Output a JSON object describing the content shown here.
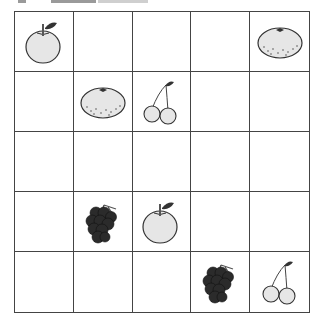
{
  "grid": {
    "rows": 5,
    "cols": 5,
    "cells": [
      [
        "apple",
        "",
        "",
        "",
        "mandarin"
      ],
      [
        "",
        "mandarin",
        "cherry",
        "",
        ""
      ],
      [
        "",
        "",
        "",
        "",
        ""
      ],
      [
        "",
        "grapes",
        "apple",
        "",
        ""
      ],
      [
        "",
        "",
        "",
        "grapes",
        "cherry"
      ]
    ]
  },
  "fruit_labels": {
    "apple": "apple",
    "mandarin": "mandarin orange",
    "cherry": "cherries",
    "grapes": "grapes"
  },
  "colors": {
    "grid_line": "#444444",
    "fruit_fill": "#e6e6e6",
    "outline": "#333333",
    "grapes_fill": "#2b2b2b",
    "leaf": "#333333"
  }
}
